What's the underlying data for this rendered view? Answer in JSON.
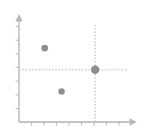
{
  "chart_data": {
    "type": "scatter",
    "title": "",
    "subtitle": "",
    "xlabel": "",
    "ylabel": "",
    "grid": false,
    "legend": false,
    "legend_position": "none",
    "axis_style": "arrow-tipped",
    "xlim": [
      0,
      10
    ],
    "ylim": [
      0,
      8
    ],
    "x_tick_count": 9,
    "y_tick_count": 7,
    "x_tick_labels": [],
    "y_tick_labels": [],
    "series": [
      {
        "name": "points",
        "marker": "circle",
        "color": "#8e8e8e",
        "points": [
          {
            "label": "point-1",
            "x": 2.3,
            "y": 5.8,
            "radius": 3.4
          },
          {
            "label": "point-2",
            "x": 3.8,
            "y": 2.4,
            "radius": 3.2
          },
          {
            "label": "point-3",
            "x": 6.8,
            "y": 4.1,
            "radius": 4.2
          }
        ]
      }
    ],
    "annotations": [
      {
        "type": "guide-line",
        "name": "horizontal-guide",
        "orientation": "horizontal",
        "at_y": 4.1,
        "from_x": 0,
        "to_x": 9.6,
        "style": "dotted",
        "color": "#b8b8b8"
      },
      {
        "type": "guide-line",
        "name": "vertical-guide",
        "orientation": "vertical",
        "at_x": 6.8,
        "from_y": 0,
        "to_y": 7.6,
        "style": "dotted",
        "color": "#b8b8b8"
      }
    ],
    "colors": {
      "background": "#ffffff",
      "axis": "#b0b0b0",
      "tick": "#b8b8b8",
      "marker": "#8e8e8e",
      "guide": "#bdbdbd"
    }
  }
}
